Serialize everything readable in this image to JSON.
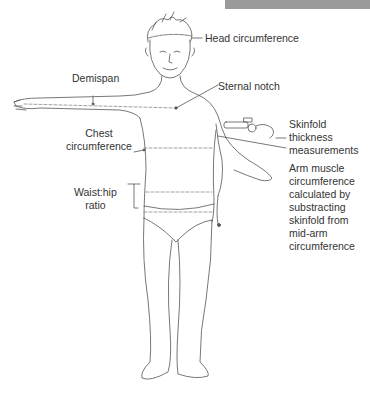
{
  "header_bar": {
    "color": "#9a9a9a"
  },
  "colors": {
    "line": "#555555",
    "text": "#333333",
    "dashed": "#888888"
  },
  "labels": {
    "head_circumference": "Head circumference",
    "demispan": "Demispan",
    "sternal_notch": "Sternal notch",
    "chest_circumference": "Chest\ncircumference",
    "skinfold": "Skinfold\nthickness\nmeasurements",
    "arm_muscle": "Arm muscle\ncircumference\ncalculated by\nsubstracting\nskinfold from\nmid-arm\ncircumference",
    "waist_hip": "Waist:hip\nratio"
  }
}
